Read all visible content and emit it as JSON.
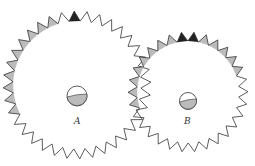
{
  "figure": {
    "gears": [
      {
        "id": "A",
        "label": "A",
        "teeth": 36
      },
      {
        "id": "B",
        "label": "B",
        "teeth": 30
      }
    ],
    "colors": {
      "stroke": "#333333",
      "shade": "#bbbbbb",
      "dark": "#222222",
      "fill": "#ffffff"
    }
  }
}
